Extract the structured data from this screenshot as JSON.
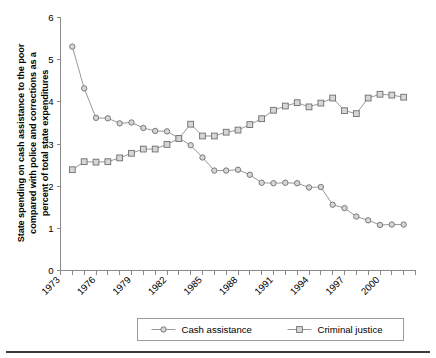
{
  "chart_data": {
    "type": "line",
    "title": "",
    "subtitle": "",
    "xlabel": "",
    "ylabel": "State spending on cash assistance to the poor compared with police and corrections as a percent of total state expenditures",
    "ylabel_lines": [
      "State spending on cash assistance to the poor",
      "compared with police and corrections as a",
      "percent of total state expenditures"
    ],
    "x": [
      1974,
      1975,
      1976,
      1977,
      1978,
      1979,
      1980,
      1981,
      1982,
      1983,
      1984,
      1985,
      1986,
      1987,
      1988,
      1989,
      1990,
      1991,
      1992,
      1993,
      1994,
      1995,
      1996,
      1997,
      1998,
      1999,
      2000,
      2001,
      2002
    ],
    "xlim": [
      1973,
      2003
    ],
    "ylim": [
      0,
      6
    ],
    "ytick_labels": [
      "0",
      "1",
      "2",
      "3",
      "4",
      "5",
      "6"
    ],
    "yticks": [
      0,
      1,
      2,
      3,
      4,
      5,
      6
    ],
    "xtick_labels": [
      "1973",
      "1976",
      "1979",
      "1982",
      "1985",
      "1988",
      "1991",
      "1994",
      "1997",
      "2000"
    ],
    "xticks_labeled": [
      1973,
      1976,
      1979,
      1982,
      1985,
      1988,
      1991,
      1994,
      1997,
      2000
    ],
    "xticks_all": [
      1973,
      1974,
      1975,
      1976,
      1977,
      1978,
      1979,
      1980,
      1981,
      1982,
      1983,
      1984,
      1985,
      1986,
      1987,
      1988,
      1989,
      1990,
      1991,
      1992,
      1993,
      1994,
      1995,
      1996,
      1997,
      1998,
      1999,
      2000,
      2001,
      2002,
      2003
    ],
    "grid": false,
    "legend_position": "bottom",
    "series": [
      {
        "name": "Cash assistance",
        "marker": "circle",
        "color": "#8c8c8c",
        "values": [
          5.31,
          4.32,
          3.62,
          3.61,
          3.49,
          3.51,
          3.38,
          3.31,
          3.3,
          3.14,
          2.97,
          2.68,
          2.37,
          2.37,
          2.39,
          2.27,
          2.08,
          2.07,
          2.08,
          2.07,
          1.97,
          1.98,
          1.56,
          1.48,
          1.28,
          1.19,
          1.08,
          1.09,
          1.09
        ]
      },
      {
        "name": "Criminal justice",
        "marker": "square",
        "color": "#8c8c8c",
        "values": [
          2.39,
          2.58,
          2.57,
          2.58,
          2.67,
          2.78,
          2.88,
          2.88,
          2.99,
          3.13,
          3.47,
          3.19,
          3.19,
          3.28,
          3.33,
          3.46,
          3.6,
          3.8,
          3.9,
          3.98,
          3.88,
          3.97,
          4.09,
          3.79,
          3.72,
          4.09,
          4.18,
          4.16,
          4.11
        ]
      }
    ]
  },
  "legend": {
    "items": [
      {
        "label": "Cash assistance",
        "marker": "circle"
      },
      {
        "label": "Criminal justice",
        "marker": "square"
      }
    ]
  }
}
